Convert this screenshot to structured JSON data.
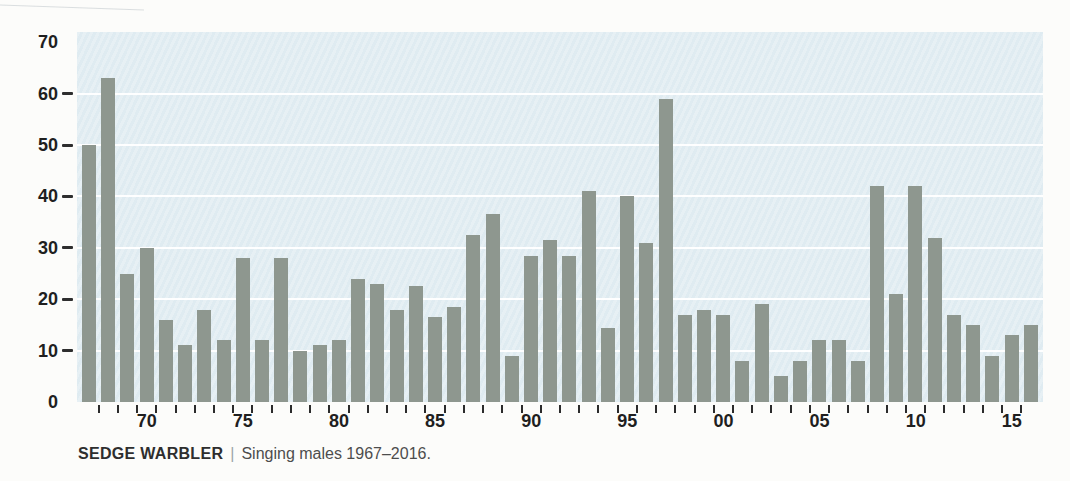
{
  "page": {
    "background": "#fcfcfa"
  },
  "chart_data": {
    "type": "bar",
    "title": "SEDGE WARBLER",
    "subtitle": "Singing males 1967–2016.",
    "xlabel": "",
    "ylabel": "",
    "ylim": [
      0,
      70
    ],
    "yticks": [
      0,
      10,
      20,
      30,
      40,
      50,
      60,
      70
    ],
    "gridline_values": [
      10,
      20,
      30,
      40,
      50,
      60
    ],
    "grid": "horizontal-white-on-panel",
    "legend": "none",
    "xtick_labels": [
      "70",
      "75",
      "80",
      "85",
      "90",
      "95",
      "00",
      "05",
      "10",
      "15"
    ],
    "xtick_label_years": [
      1970,
      1975,
      1980,
      1985,
      1990,
      1995,
      2000,
      2005,
      2010,
      2015
    ],
    "x": [
      1967,
      1968,
      1969,
      1970,
      1971,
      1972,
      1973,
      1974,
      1975,
      1976,
      1977,
      1978,
      1979,
      1980,
      1981,
      1982,
      1983,
      1984,
      1985,
      1986,
      1987,
      1988,
      1989,
      1990,
      1991,
      1992,
      1993,
      1994,
      1995,
      1996,
      1997,
      1998,
      1999,
      2000,
      2001,
      2002,
      2003,
      2004,
      2005,
      2006,
      2007,
      2008,
      2009,
      2010,
      2011,
      2012,
      2013,
      2014,
      2015,
      2016
    ],
    "values": [
      50,
      63,
      25,
      30,
      16,
      11,
      18,
      12,
      28,
      12,
      28,
      10,
      11,
      12,
      24,
      23,
      18,
      22.5,
      16.5,
      18.5,
      32.5,
      36.5,
      9,
      28.5,
      31.5,
      28.5,
      41,
      14.5,
      40,
      31,
      59,
      17,
      18,
      17,
      8,
      19,
      5,
      8,
      12,
      12,
      8,
      42,
      21,
      42,
      32,
      17,
      15,
      9,
      13,
      15
    ],
    "colors": {
      "bar": "#8e978f",
      "panel": "#e2edf2",
      "gridline": "#ffffff",
      "axis_text": "#1f1f1f",
      "tick": "#2b2b2b"
    }
  },
  "caption": {
    "species": "SEDGE WARBLER",
    "separator": "|",
    "text": "Singing males 1967–2016."
  }
}
